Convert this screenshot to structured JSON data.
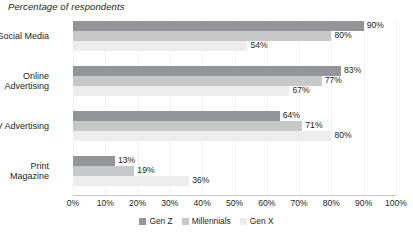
{
  "chart_data": {
    "type": "bar",
    "orientation": "horizontal",
    "title": "Percentage of respondents",
    "xlabel": "",
    "ylabel": "",
    "xlim": [
      0,
      100
    ],
    "grid": true,
    "legend_position": "bottom",
    "categories": [
      "Social Media",
      "Online Advertising",
      "TV Advertising",
      "Print Magazine"
    ],
    "category_lines": [
      [
        "Social Media"
      ],
      [
        "Online",
        "Advertising"
      ],
      [
        "TV Advertising"
      ],
      [
        "Print",
        "Magazine"
      ]
    ],
    "xticks": [
      "0%",
      "10%",
      "20%",
      "30%",
      "40%",
      "50%",
      "60%",
      "70%",
      "80%",
      "90%",
      "100%"
    ],
    "xtick_values": [
      0,
      10,
      20,
      30,
      40,
      50,
      60,
      70,
      80,
      90,
      100
    ],
    "series": [
      {
        "name": "Gen Z",
        "color": "#939598",
        "values": [
          90,
          83,
          64,
          13
        ],
        "labels": [
          "90%",
          "83%",
          "64%",
          "13%"
        ]
      },
      {
        "name": "Millennials",
        "color": "#c7c8ca",
        "values": [
          80,
          77,
          71,
          19
        ],
        "labels": [
          "80%",
          "77%",
          "71%",
          "19%"
        ]
      },
      {
        "name": "Gen X",
        "color": "#ededee",
        "values": [
          54,
          67,
          80,
          36
        ],
        "labels": [
          "54%",
          "67%",
          "80%",
          "36%"
        ]
      }
    ]
  }
}
